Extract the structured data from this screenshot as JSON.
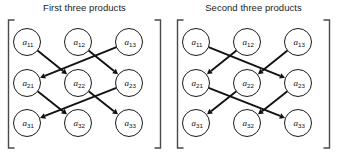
{
  "figure": {
    "width": 338,
    "height": 155,
    "background": "#ffffff",
    "ink_color": "#121212",
    "bracket_color": "#4a4a4a"
  },
  "panels": [
    {
      "id": "first-three-products",
      "title": "First three products",
      "nodes": [
        {
          "id": "a11",
          "base": "a",
          "sub": "11",
          "row": 0,
          "col": 0
        },
        {
          "id": "a12",
          "base": "a",
          "sub": "12",
          "row": 0,
          "col": 1
        },
        {
          "id": "a13",
          "base": "a",
          "sub": "13",
          "row": 0,
          "col": 2
        },
        {
          "id": "a21",
          "base": "a",
          "sub": "21",
          "row": 1,
          "col": 0
        },
        {
          "id": "a22",
          "base": "a",
          "sub": "22",
          "row": 1,
          "col": 1
        },
        {
          "id": "a23",
          "base": "a",
          "sub": "23",
          "row": 1,
          "col": 2
        },
        {
          "id": "a31",
          "base": "a",
          "sub": "31",
          "row": 2,
          "col": 0
        },
        {
          "id": "a32",
          "base": "a",
          "sub": "32",
          "row": 2,
          "col": 1
        },
        {
          "id": "a33",
          "base": "a",
          "sub": "33",
          "row": 2,
          "col": 2
        }
      ],
      "edges": [
        {
          "from": "a11",
          "to": "a22"
        },
        {
          "from": "a12",
          "to": "a23"
        },
        {
          "from": "a13",
          "to": "a21"
        },
        {
          "from": "a21",
          "to": "a32"
        },
        {
          "from": "a22",
          "to": "a33"
        },
        {
          "from": "a23",
          "to": "a31"
        }
      ]
    },
    {
      "id": "second-three-products",
      "title": "Second three products",
      "nodes": [
        {
          "id": "a11",
          "base": "a",
          "sub": "11",
          "row": 0,
          "col": 0
        },
        {
          "id": "a12",
          "base": "a",
          "sub": "12",
          "row": 0,
          "col": 1
        },
        {
          "id": "a13",
          "base": "a",
          "sub": "13",
          "row": 0,
          "col": 2
        },
        {
          "id": "a21",
          "base": "a",
          "sub": "21",
          "row": 1,
          "col": 0
        },
        {
          "id": "a22",
          "base": "a",
          "sub": "22",
          "row": 1,
          "col": 1
        },
        {
          "id": "a23",
          "base": "a",
          "sub": "23",
          "row": 1,
          "col": 2
        },
        {
          "id": "a31",
          "base": "a",
          "sub": "31",
          "row": 2,
          "col": 0
        },
        {
          "id": "a32",
          "base": "a",
          "sub": "32",
          "row": 2,
          "col": 1
        },
        {
          "id": "a33",
          "base": "a",
          "sub": "33",
          "row": 2,
          "col": 2
        }
      ],
      "edges": [
        {
          "from": "a11",
          "to": "a23"
        },
        {
          "from": "a12",
          "to": "a21"
        },
        {
          "from": "a13",
          "to": "a22"
        },
        {
          "from": "a21",
          "to": "a33"
        },
        {
          "from": "a22",
          "to": "a31"
        },
        {
          "from": "a23",
          "to": "a32"
        }
      ]
    }
  ]
}
